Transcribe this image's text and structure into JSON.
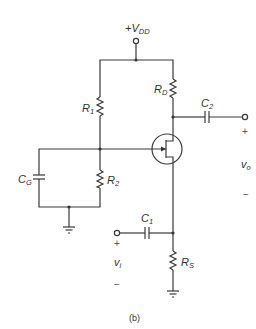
{
  "diagram": {
    "caption": "(b)",
    "type": "JFET common-gate amplifier",
    "supply": {
      "label": "+V",
      "sub": "DD"
    },
    "components": [
      {
        "id": "R1",
        "label": "R",
        "sub": "1",
        "kind": "resistor"
      },
      {
        "id": "R2",
        "label": "R",
        "sub": "2",
        "kind": "resistor"
      },
      {
        "id": "RD",
        "label": "R",
        "sub": "D",
        "kind": "resistor"
      },
      {
        "id": "RS",
        "label": "R",
        "sub": "S",
        "kind": "resistor"
      },
      {
        "id": "C1",
        "label": "C",
        "sub": "1",
        "kind": "capacitor"
      },
      {
        "id": "C2",
        "label": "C",
        "sub": "2",
        "kind": "capacitor"
      },
      {
        "id": "CG",
        "label": "C",
        "sub": "G",
        "kind": "capacitor"
      },
      {
        "id": "Q1",
        "label": "",
        "kind": "n-channel JFET"
      }
    ],
    "input": {
      "label": "v",
      "sub": "i",
      "plus": "+",
      "minus": "−"
    },
    "output": {
      "label": "v",
      "sub": "o",
      "plus": "+",
      "minus": "−"
    }
  }
}
